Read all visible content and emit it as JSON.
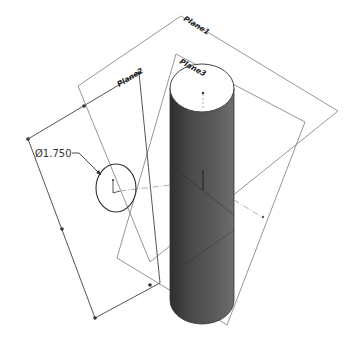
{
  "drawing": {
    "background": "#ffffff",
    "planes": [
      {
        "name": "Plane1",
        "label": "Plane1"
      },
      {
        "name": "Plane2",
        "label": "Plane2"
      },
      {
        "name": "Plane3",
        "label": "Plane3"
      }
    ],
    "dimension": {
      "label": "Ø1.750",
      "symbol": "Ø",
      "value": "1.750"
    },
    "feature": {
      "type": "cylinder",
      "fill_color": "#4a4a4a"
    },
    "sketch": {
      "type": "circle"
    }
  }
}
